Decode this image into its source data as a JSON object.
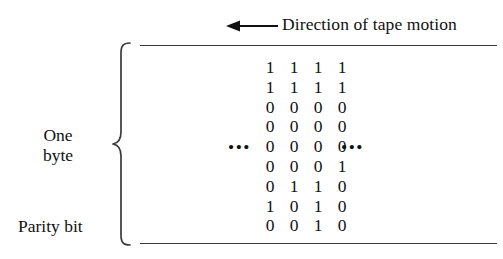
{
  "figure": {
    "background_color": "#ffffff",
    "ink_color": "#111111",
    "rule_color": "#3a3a3a"
  },
  "caption": {
    "direction_text": "Direction of tape motion",
    "arrow_icon": "arrow-left-icon",
    "arrow_direction": "left"
  },
  "labels": {
    "one_byte_line1": "One",
    "one_byte_line2": "byte",
    "parity_bit": "Parity bit",
    "brace_icon": "curly-brace-left-icon"
  },
  "tape": {
    "top_rule": "tape-edge-top",
    "bottom_rule": "tape-edge-bottom"
  },
  "ellipsis": {
    "left": "•••",
    "right": "•••",
    "on_row_index": 4
  },
  "chart_data": {
    "type": "table",
    "title": "Direction of tape motion",
    "row_labels": [
      "",
      "",
      "",
      "",
      "",
      "",
      "",
      "",
      "Parity bit"
    ],
    "group_label": "One byte",
    "columns": 4,
    "rows": 9,
    "values": [
      [
        "1",
        "1",
        "1",
        "1"
      ],
      [
        "1",
        "1",
        "1",
        "1"
      ],
      [
        "0",
        "0",
        "0",
        "0"
      ],
      [
        "0",
        "0",
        "0",
        "0"
      ],
      [
        "0",
        "0",
        "0",
        "0"
      ],
      [
        "0",
        "0",
        "0",
        "1"
      ],
      [
        "0",
        "1",
        "1",
        "0"
      ],
      [
        "1",
        "0",
        "1",
        "0"
      ],
      [
        "0",
        "0",
        "1",
        "0"
      ]
    ]
  }
}
